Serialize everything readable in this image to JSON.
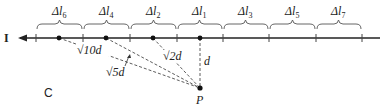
{
  "figure": {
    "current_label": "I",
    "segments": [
      {
        "label": "Δl6",
        "sub": "6",
        "x1": 36,
        "x2": 83
      },
      {
        "label": "Δl4",
        "sub": "4",
        "x1": 83,
        "x2": 130
      },
      {
        "label": "Δl2",
        "sub": "2",
        "x1": 130,
        "x2": 177
      },
      {
        "label": "Δl1",
        "sub": "1",
        "x1": 177,
        "x2": 223
      },
      {
        "label": "Δl3",
        "sub": "3",
        "x1": 223,
        "x2": 269
      },
      {
        "label": "Δl5",
        "sub": "5",
        "x1": 269,
        "x2": 316
      },
      {
        "label": "Δl7",
        "sub": "7",
        "x1": 316,
        "x2": 362
      }
    ],
    "distances": {
      "sqrt10d": "√10d",
      "sqrt5d": "√5d",
      "sqrt2d": "√2d",
      "d": "d"
    },
    "point_label": "P",
    "panel_label": "C"
  }
}
